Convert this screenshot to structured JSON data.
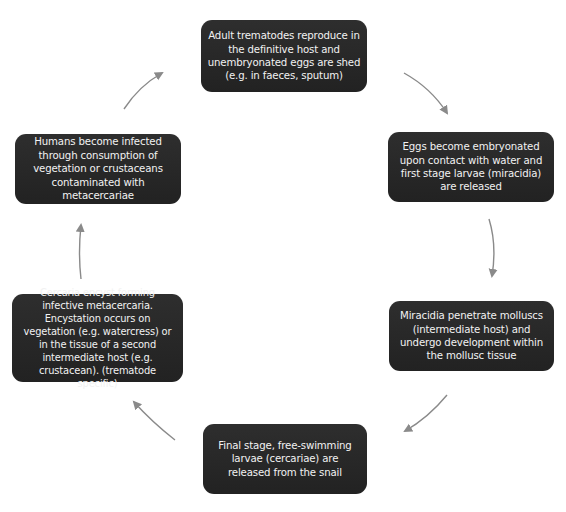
{
  "diagram": {
    "type": "life-cycle",
    "direction": "clockwise",
    "colors": {
      "box_fill": "#262626",
      "box_text": "#f2f2f2",
      "arrow": "#8a8a8a",
      "background": "#ffffff"
    },
    "stages": [
      {
        "id": 1,
        "label": "Adult trematodes reproduce in the definitive host and unembryonated eggs are shed (e.g. in faeces, sputum)"
      },
      {
        "id": 2,
        "label": "Eggs become embryonated upon contact with water and first stage larvae (miracidia) are released"
      },
      {
        "id": 3,
        "label": "Miracidia penetrate molluscs (intermediate host) and undergo development within the mollusc tissue"
      },
      {
        "id": 4,
        "label": "Final stage, free-swimming larvae (cercariae) are released from the snail"
      },
      {
        "id": 5,
        "label": "Cercaria encyst forming infective metacercaria. Encystation occurs on vegetation (e.g. watercress) or in the tissue of a second intermediate host (e.g. crustacean). (trematode specific)"
      },
      {
        "id": 6,
        "label": "Humans become infected through consumption of vegetation or crustaceans contaminated with metacercariae"
      }
    ],
    "arrows": [
      {
        "from": 1,
        "to": 2
      },
      {
        "from": 2,
        "to": 3
      },
      {
        "from": 3,
        "to": 4
      },
      {
        "from": 4,
        "to": 5
      },
      {
        "from": 5,
        "to": 6
      },
      {
        "from": 6,
        "to": 1
      }
    ]
  }
}
